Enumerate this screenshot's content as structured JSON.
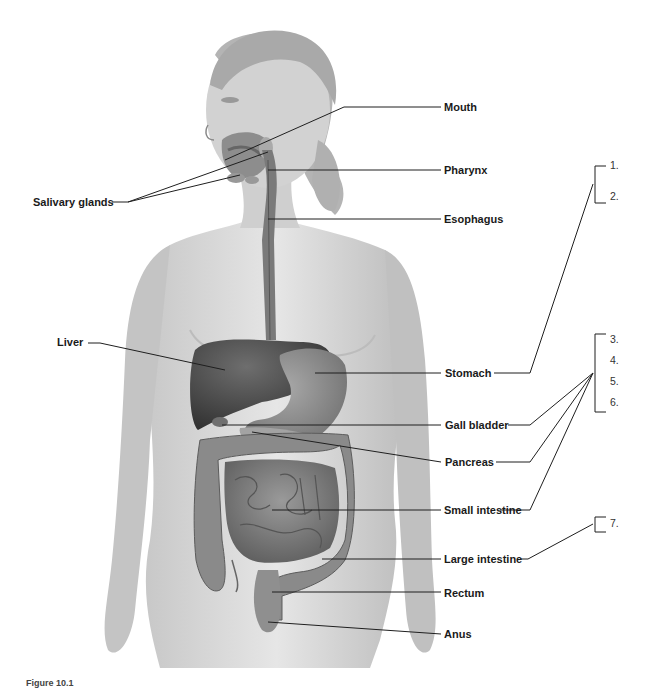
{
  "diagram": {
    "type": "anatomy-labeling",
    "labels": {
      "mouth": "Mouth",
      "salivary_glands": "Salivary glands",
      "pharynx": "Pharynx",
      "esophagus": "Esophagus",
      "liver": "Liver",
      "stomach": "Stomach",
      "gall_bladder": "Gall bladder",
      "pancreas": "Pancreas",
      "small_intestine": "Small intestine",
      "large_intestine": "Large intestine",
      "rectum": "Rectum",
      "anus": "Anus"
    },
    "blanks": [
      "1.",
      "2.",
      "3.",
      "4.",
      "5.",
      "6.",
      "7."
    ],
    "caption": "Figure 10.1"
  }
}
